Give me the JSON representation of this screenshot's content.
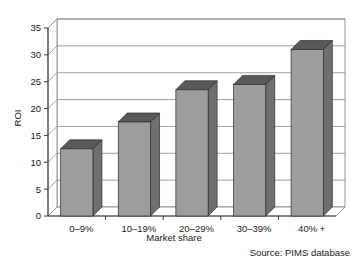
{
  "chart_data": {
    "type": "bar",
    "title": "",
    "subtitle": "",
    "xlabel": "Market share",
    "ylabel": "ROI",
    "categories": [
      "0–9%",
      "10–19%",
      "20–29%",
      "30–39%",
      "40% +"
    ],
    "values": [
      12.5,
      17.5,
      23.5,
      24.5,
      31
    ],
    "series": [
      {
        "name": "ROI",
        "values": [
          12.5,
          17.5,
          23.5,
          24.5,
          31
        ]
      }
    ],
    "ylim": [
      0,
      35
    ],
    "xlim": null,
    "ytick_labels": [
      "0",
      "5",
      "10",
      "15",
      "20",
      "25",
      "30",
      "35"
    ],
    "ytick_values": [
      0,
      5,
      10,
      15,
      20,
      25,
      30,
      35
    ],
    "ytick_step": 5,
    "grid": true,
    "grid_axis": "y",
    "legend": false,
    "legend_position": "none",
    "annotations": [
      "Source: PIMS database"
    ],
    "style": "3d-column",
    "colors": {
      "bar_front": "#9d9d9d",
      "bar_top": "#595959",
      "bar_side": "#6f6f6f",
      "bar_edge": "#2b2b2b",
      "grid_line": "#8c8c8c",
      "axis_line": "#3a3a3a",
      "text": "#1a1a1a",
      "background": "#ffffff"
    }
  },
  "source": {
    "label": "Source: PIMS database"
  },
  "axes": {
    "y_title": "ROI",
    "x_title": "Market share"
  }
}
